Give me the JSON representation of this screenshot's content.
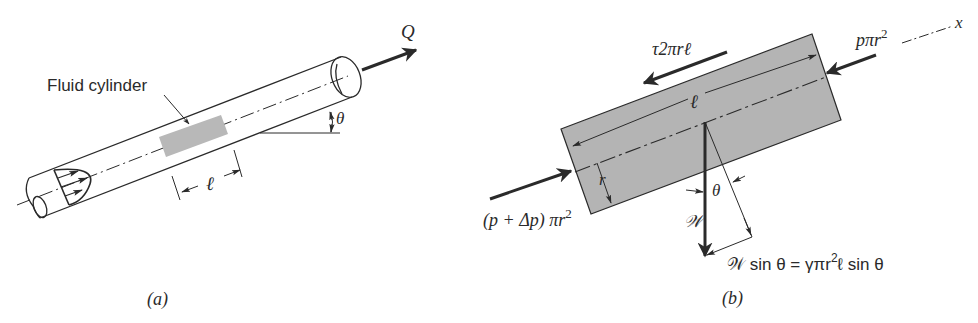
{
  "figure": {
    "colors": {
      "ink": "#2a2a2a",
      "fluid_fill": "#b8b8b8",
      "fluid_fill_dark": "#b0b0b0",
      "background": "#ffffff",
      "ghost_text": "#e9e9e9"
    },
    "panel_a": {
      "caption": "(a)",
      "fluid_cylinder_label": "Fluid cylinder",
      "flow_label": "Q",
      "angle_label": "θ",
      "length_label": "ℓ"
    },
    "panel_b": {
      "caption": "(b)",
      "shear_force_label": "τ2πrℓ",
      "downstream_pressure_label_main": "pπr",
      "downstream_pressure_exp": "2",
      "upstream_pressure_label_main": "(p + Δp) πr",
      "upstream_pressure_exp": "2",
      "axis_label": "x",
      "length_label": "ℓ",
      "radius_label": "r",
      "angle_label": "θ",
      "weight_label": "𝒲",
      "weight_component_label_lhs": "𝒲 sin θ = γπr",
      "weight_component_exp": "2",
      "weight_component_label_rhs": "ℓ sin θ"
    }
  }
}
